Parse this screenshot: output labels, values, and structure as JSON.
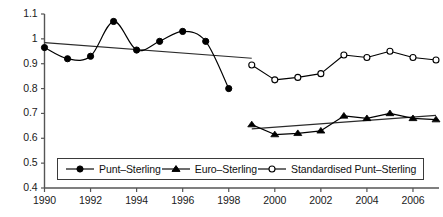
{
  "chart_data": {
    "type": "line",
    "title": "",
    "xlabel": "",
    "ylabel": "",
    "xlim": [
      1990,
      2007
    ],
    "ylim": [
      0.4,
      1.1
    ],
    "grid": false,
    "legend_position": "bottom-inside",
    "y_ticks": [
      "0.4",
      "0.5",
      "0.6",
      "0.7",
      "0.8",
      "0.9",
      "1",
      "1.1"
    ],
    "y_tick_values": [
      0.4,
      0.5,
      0.6,
      0.7,
      0.8,
      0.9,
      1.0,
      1.1
    ],
    "x_ticks": [
      "1990",
      "1992",
      "1994",
      "1996",
      "1998",
      "2000",
      "2002",
      "2004",
      "2006"
    ],
    "x_tick_values": [
      1990,
      1992,
      1994,
      1996,
      1998,
      2000,
      2002,
      2004,
      2006
    ],
    "series": [
      {
        "name": "Punt-Sterling",
        "marker": "filled-circle",
        "x": [
          1990,
          1991,
          1992,
          1993,
          1994,
          1995,
          1996,
          1997,
          1998
        ],
        "values": [
          0.965,
          0.92,
          0.93,
          1.07,
          0.955,
          0.99,
          1.03,
          0.99,
          0.8
        ],
        "smooth": true
      },
      {
        "name": "Euro-Sterling",
        "marker": "filled-triangle",
        "x": [
          1999,
          2000,
          2001,
          2002,
          2003,
          2004,
          2005,
          2006,
          2007
        ],
        "values": [
          0.655,
          0.615,
          0.62,
          0.63,
          0.69,
          0.68,
          0.7,
          0.68,
          0.675
        ],
        "smooth": false
      },
      {
        "name": "Standardised Punt-Sterling",
        "marker": "open-circle",
        "x": [
          1999,
          2000,
          2001,
          2002,
          2003,
          2004,
          2005,
          2006,
          2007
        ],
        "values": [
          0.895,
          0.835,
          0.845,
          0.86,
          0.935,
          0.925,
          0.95,
          0.925,
          0.915
        ],
        "smooth": false
      }
    ],
    "trendlines": [
      {
        "name": "Punt-Sterling trend",
        "x": [
          1990,
          1999
        ],
        "values": [
          0.985,
          0.922
        ]
      },
      {
        "name": "Euro-Sterling trend",
        "x": [
          1999,
          2007
        ],
        "values": [
          0.638,
          0.692
        ]
      }
    ]
  },
  "legend": {
    "entries": [
      {
        "label": "Punt–Sterling",
        "marker": "filled-circle"
      },
      {
        "label": "Euro–Sterling",
        "marker": "filled-triangle"
      },
      {
        "label": "Standardised Punt–Sterling",
        "marker": "open-circle"
      }
    ]
  }
}
